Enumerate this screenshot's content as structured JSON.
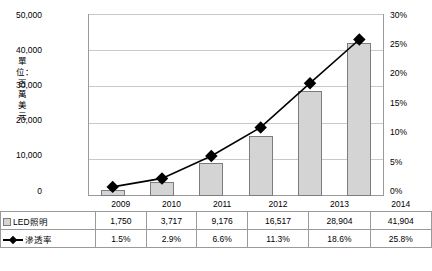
{
  "chart_data": {
    "type": "bar",
    "title": "",
    "xlabel": "",
    "ylabel": "單位：百萬美元",
    "categories": [
      "2009",
      "2010",
      "2011",
      "2012",
      "2013",
      "2014"
    ],
    "series": [
      {
        "name": "LED照明",
        "type": "bar",
        "axis": "left",
        "values": [
          1750,
          3717,
          9176,
          16517,
          28904,
          41904
        ],
        "labels": [
          "1,750",
          "3,717",
          "9,176",
          "16,517",
          "28,904",
          "41,904"
        ]
      },
      {
        "name": "滲透率",
        "type": "line",
        "axis": "right",
        "values": [
          1.5,
          2.9,
          6.6,
          11.3,
          18.6,
          25.8
        ],
        "labels": [
          "1.5%",
          "2.9%",
          "6.6%",
          "11.3%",
          "18.6%",
          "25.8%"
        ]
      }
    ],
    "left_axis": {
      "ticks": [
        "0",
        "10,000",
        "20,000",
        "30,000",
        "40,000",
        "50,000"
      ],
      "min": 0,
      "max": 50000
    },
    "right_axis": {
      "ticks": [
        "0%",
        "5%",
        "10%",
        "15%",
        "20%",
        "25%",
        "30%"
      ],
      "min": 0,
      "max": 30
    },
    "grid": true,
    "legend_position": "table-left",
    "colors": {
      "bar_fill": "#d4d4d4",
      "bar_border": "#7c7c7c",
      "line": "#000000",
      "grid": "#c9c9c9"
    }
  },
  "table": {
    "row_labels": [
      "LED照明",
      "滲透率"
    ]
  }
}
